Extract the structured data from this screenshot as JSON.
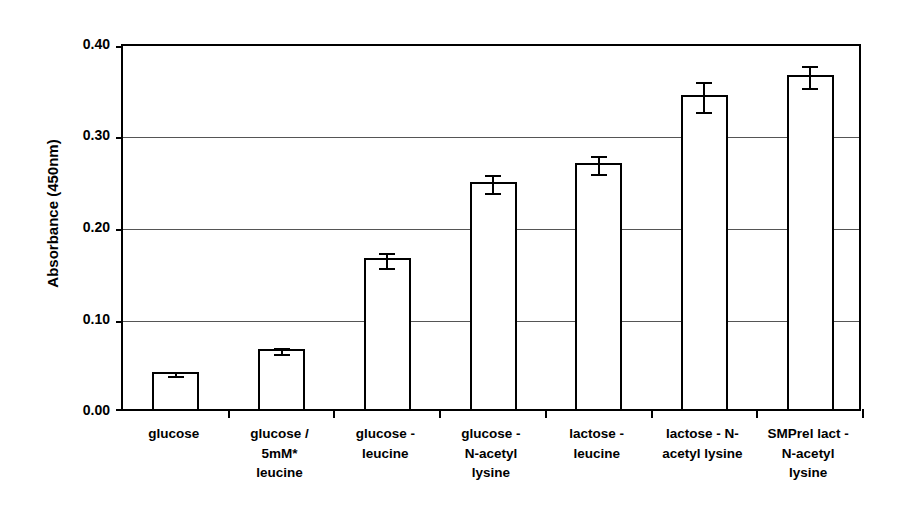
{
  "chart_data": {
    "type": "bar",
    "title": "",
    "xlabel": "",
    "ylabel": "Absorbance (450nm)",
    "ylim": [
      0.0,
      0.4
    ],
    "yticks": [
      "0.00",
      "0.10",
      "0.20",
      "0.30",
      "0.40"
    ],
    "ytick_values": [
      0.0,
      0.1,
      0.2,
      0.3,
      0.4
    ],
    "grid": true,
    "legend": "none",
    "bar_fill_color": "#ffffff",
    "bar_edge_color": "#000000",
    "categories": [
      "glucose",
      "glucose / 5mM* leucine",
      "glucose - leucine",
      "glucose - N-acetyl lysine",
      "lactose - leucine",
      "lactose - N- acetyl lysine",
      "SMPrel lact - N-acetyl lysine"
    ],
    "category_lines": [
      [
        "glucose"
      ],
      [
        "glucose /",
        "5mM*",
        "leucine"
      ],
      [
        "glucose -",
        "leucine"
      ],
      [
        "glucose -",
        "N-acetyl",
        "lysine"
      ],
      [
        "lactose -",
        "leucine"
      ],
      [
        "lactose - N-",
        "acetyl lysine"
      ],
      [
        "SMPrel lact -",
        "N-acetyl",
        "lysine"
      ]
    ],
    "values": [
      0.041,
      0.066,
      0.166,
      0.25,
      0.271,
      0.346,
      0.368
    ],
    "errors": [
      0.002,
      0.003,
      0.008,
      0.01,
      0.01,
      0.017,
      0.012
    ]
  }
}
